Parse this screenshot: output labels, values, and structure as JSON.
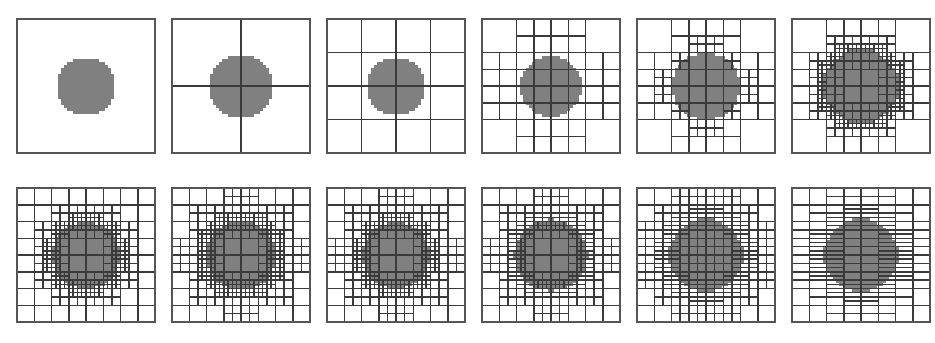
{
  "figure": {
    "rows": 2,
    "columns": 6,
    "panel_count": 12,
    "background_color": "#ffffff",
    "border_color": "#555555",
    "grid_line_color": "#3a3a3a",
    "fill_color": "#808080",
    "panel_width": 144,
    "panel_height": 140
  },
  "chart_data": {
    "type": "diagram",
    "xlabel": "",
    "ylabel": "",
    "grid": true,
    "legend": "none",
    "domain": {
      "x": [
        0,
        1
      ],
      "y": [
        0,
        1
      ]
    },
    "shape": {
      "kind": "circle",
      "center": [
        0.5,
        0.5
      ],
      "pixelated": true,
      "fill": "#808080"
    },
    "panels": [
      {
        "index": 1,
        "label": "level 0",
        "base_grid": 1,
        "max_level": 0,
        "circle_radius": 0.215,
        "anisotropy": "none",
        "refine_bands": []
      },
      {
        "index": 2,
        "label": "level 1",
        "base_grid": 2,
        "max_level": 1,
        "circle_radius": 0.235,
        "anisotropy": "none",
        "refine_bands": []
      },
      {
        "index": 3,
        "label": "level 2",
        "base_grid": 4,
        "max_level": 2,
        "circle_radius": 0.215,
        "anisotropy": "none",
        "refine_bands": []
      },
      {
        "index": 4,
        "label": "level 3",
        "base_grid": 4,
        "max_level": 3,
        "circle_radius": 0.225,
        "anisotropy": "none",
        "refine_bands": [
          {
            "level": 1,
            "inner": 0.14,
            "outer": 0.4
          }
        ]
      },
      {
        "index": 5,
        "label": "level 4",
        "base_grid": 4,
        "max_level": 4,
        "circle_radius": 0.25,
        "anisotropy": "none",
        "refine_bands": [
          {
            "level": 1,
            "inner": 0.1,
            "outer": 0.46
          },
          {
            "level": 2,
            "inner": 0.2,
            "outer": 0.34
          }
        ]
      },
      {
        "index": 6,
        "label": "level 5",
        "base_grid": 4,
        "max_level": 5,
        "circle_radius": 0.275,
        "anisotropy": "none",
        "refine_bands": [
          {
            "level": 1,
            "inner": 0.1,
            "outer": 0.5
          },
          {
            "level": 2,
            "inner": 0.18,
            "outer": 0.4
          },
          {
            "level": 3,
            "inner": 0.245,
            "outer": 0.325
          }
        ]
      },
      {
        "index": 7,
        "label": "level 6",
        "base_grid": 8,
        "max_level": 5,
        "circle_radius": 0.25,
        "anisotropy": "none",
        "refine_bands": [
          {
            "level": 1,
            "inner": 0.14,
            "outer": 0.44
          },
          {
            "level": 2,
            "inner": 0.215,
            "outer": 0.315
          }
        ]
      },
      {
        "index": 8,
        "label": "level 7",
        "base_grid": 8,
        "max_level": 6,
        "circle_radius": 0.258,
        "anisotropy": "none",
        "refine_bands": [
          {
            "level": 1,
            "inner": 0.13,
            "outer": 0.45
          },
          {
            "level": 2,
            "inner": 0.22,
            "outer": 0.325
          }
        ]
      },
      {
        "index": 9,
        "label": "level 8",
        "base_grid": 8,
        "max_level": 6,
        "circle_radius": 0.248,
        "anisotropy": "slight-horizontal",
        "refine_bands": [
          {
            "level": 1,
            "inner": 0.12,
            "outer": 0.46
          },
          {
            "level": 2,
            "inner": 0.205,
            "outer": 0.32
          }
        ]
      },
      {
        "index": 10,
        "label": "level 9",
        "base_grid": 8,
        "max_level": 6,
        "circle_radius": 0.262,
        "anisotropy": "horizontal",
        "refine_bands": [
          {
            "level": 1,
            "inner": 0.11,
            "outer": 0.47
          },
          {
            "level": 2,
            "inner": 0.215,
            "outer": 0.335
          }
        ]
      },
      {
        "index": 11,
        "label": "level 10",
        "base_grid": 8,
        "max_level": 7,
        "circle_radius": 0.268,
        "anisotropy": "strong-horizontal",
        "refine_bands": [
          {
            "level": 1,
            "inner": 0.08,
            "outer": 0.48
          },
          {
            "level": 2,
            "inner": 0.2,
            "outer": 0.36
          }
        ]
      },
      {
        "index": 12,
        "label": "level 11",
        "base_grid": 8,
        "max_level": 8,
        "circle_radius": 0.268,
        "anisotropy": "full-horizontal",
        "refine_bands": [
          {
            "level": 1,
            "inner": 0.04,
            "outer": 0.5
          },
          {
            "level": 2,
            "inner": 0.19,
            "outer": 0.38
          }
        ]
      }
    ]
  }
}
